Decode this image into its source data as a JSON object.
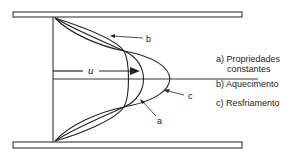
{
  "diagram": {
    "velocity_label": "u",
    "curve_labels": {
      "a": "a",
      "b": "b",
      "c": "c"
    },
    "legend": {
      "a_line1": "a) Propriedades",
      "a_line2": "constantes",
      "b": "b) Aquecimento",
      "c": "c) Resfriamento"
    },
    "colors": {
      "line": "#222222",
      "background": "#ffffff"
    }
  }
}
